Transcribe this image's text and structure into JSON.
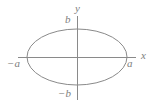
{
  "figure": {
    "kind": "ellipse-diagram",
    "background_color": "#ffffff",
    "stroke_color": "#8a8a8a",
    "label_color": "#7e7e7e",
    "width": 158,
    "height": 108,
    "origin": {
      "x": 77,
      "y": 57
    },
    "ellipse": {
      "center_x": 77,
      "center_y": 57,
      "semi_major_x": 50,
      "semi_minor_y": 28
    },
    "x_axis": {
      "x1": 18,
      "y1": 57,
      "x2": 136,
      "y2": 57
    },
    "y_axis": {
      "x1": 77,
      "y1": 16,
      "x2": 77,
      "y2": 100
    },
    "labels": {
      "y_axis_name": "y",
      "x_axis_name": "x",
      "top_vertex": "b",
      "bottom_vertex": "−b",
      "right_vertex": "a",
      "left_vertex": "−a"
    }
  }
}
